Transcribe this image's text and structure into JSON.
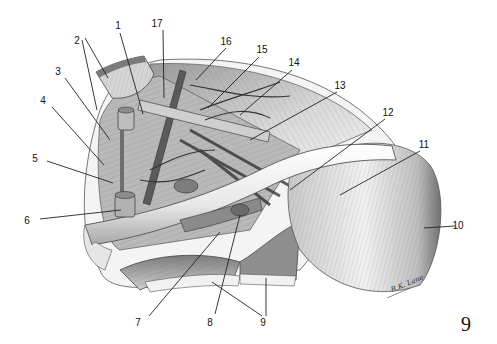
{
  "figure": {
    "type": "anatomical-illustration",
    "page_number": "9",
    "artist_signature": "R.K. Lane",
    "colors": {
      "ink": "#111111",
      "background": "#ffffff",
      "shade_dark": "#555555",
      "shade_mid": "#9a9a9a",
      "shade_light": "#dcdcdc"
    }
  },
  "labels": [
    {
      "id": "1",
      "text": "1",
      "x": 118,
      "y": 29,
      "line": [
        120,
        33,
        143,
        114
      ]
    },
    {
      "id": "2a",
      "text": "2",
      "x": 77,
      "y": 44,
      "line": [
        85,
        38,
        108,
        78
      ]
    },
    {
      "id": "2b",
      "text": "",
      "x": 0,
      "y": 0,
      "line": [
        82,
        40,
        97,
        110
      ]
    },
    {
      "id": "3",
      "text": "3",
      "x": 58,
      "y": 75,
      "line": [
        65,
        78,
        110,
        140
      ]
    },
    {
      "id": "4",
      "text": "4",
      "x": 43,
      "y": 104,
      "line": [
        52,
        107,
        104,
        165
      ]
    },
    {
      "id": "5",
      "text": "5",
      "x": 35,
      "y": 162,
      "line": [
        47,
        161,
        113,
        183
      ]
    },
    {
      "id": "6",
      "text": "6",
      "x": 27,
      "y": 224,
      "line": [
        40,
        219,
        121,
        210
      ]
    },
    {
      "id": "7",
      "text": "7",
      "x": 138,
      "y": 326,
      "line": [
        149,
        316,
        220,
        232
      ]
    },
    {
      "id": "8",
      "text": "8",
      "x": 210,
      "y": 326,
      "line": [
        215,
        314,
        240,
        215
      ]
    },
    {
      "id": "9a",
      "text": "9",
      "x": 263,
      "y": 326,
      "line": [
        262,
        316,
        212,
        282
      ]
    },
    {
      "id": "9b",
      "text": "",
      "x": 0,
      "y": 0,
      "line": [
        266,
        316,
        266,
        278
      ]
    },
    {
      "id": "10",
      "text": "10",
      "x": 458,
      "y": 229,
      "line": [
        455,
        226,
        424,
        228
      ]
    },
    {
      "id": "11",
      "text": "11",
      "x": 424,
      "y": 148,
      "line": [
        420,
        151,
        340,
        195
      ]
    },
    {
      "id": "12",
      "text": "12",
      "x": 388,
      "y": 116,
      "line": [
        385,
        119,
        290,
        190
      ]
    },
    {
      "id": "13",
      "text": "13",
      "x": 340,
      "y": 89,
      "line": [
        337,
        92,
        250,
        140
      ]
    },
    {
      "id": "14",
      "text": "14",
      "x": 294,
      "y": 66,
      "line": [
        292,
        70,
        240,
        115
      ]
    },
    {
      "id": "15",
      "text": "15",
      "x": 262,
      "y": 53,
      "line": [
        259,
        57,
        208,
        108
      ]
    },
    {
      "id": "16",
      "text": "16",
      "x": 226,
      "y": 45,
      "line": [
        226,
        48,
        196,
        80
      ]
    },
    {
      "id": "17",
      "text": "17",
      "x": 157,
      "y": 27,
      "line": [
        163,
        30,
        164,
        98
      ]
    }
  ]
}
